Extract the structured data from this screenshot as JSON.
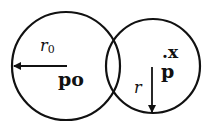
{
  "diagram": {
    "stroke_color": "#111111",
    "background": "#ffffff",
    "circles": [
      {
        "name": "left-circle",
        "cx": 66,
        "cy": 66,
        "r": 54
      },
      {
        "name": "right-circle",
        "cx": 153,
        "cy": 66,
        "r": 47
      }
    ],
    "arrows": [
      {
        "name": "r0-arrow",
        "x1": 67,
        "y1": 66,
        "x2": 13,
        "y2": 66
      },
      {
        "name": "r-arrow",
        "x1": 153,
        "y1": 67,
        "x2": 153,
        "y2": 113
      }
    ],
    "labels": {
      "r0_main": "r",
      "r0_sub": "0",
      "p0": "p",
      "p0_sub": "o",
      "x": ".x",
      "p": "p",
      "r": "r"
    }
  }
}
